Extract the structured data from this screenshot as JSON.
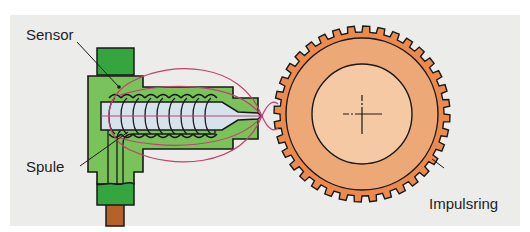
{
  "diagram": {
    "labels": {
      "sensor": "Sensor",
      "coil": "Spule",
      "impulse_ring": "Impulsring"
    },
    "components": [
      {
        "id": "sensor-housing",
        "label_ref": "sensor",
        "color": "#7ac25a"
      },
      {
        "id": "sensor-cap",
        "color": "#35a540"
      },
      {
        "id": "coil",
        "label_ref": "coil"
      },
      {
        "id": "pole-pin",
        "color": "#d7e3ec"
      },
      {
        "id": "cable",
        "color": "#b5622a"
      },
      {
        "id": "magnetic-field-lines",
        "color": "#c2416e"
      },
      {
        "id": "impulse-ring",
        "label_ref": "impulse_ring",
        "color": "#ec8a4e",
        "tooth_count": 36
      },
      {
        "id": "hub",
        "color": "#f6c9a5"
      }
    ],
    "colors": {
      "background_panel": "#ececeb",
      "outline": "#1a1a1a",
      "ring_band": "#eda878"
    }
  }
}
